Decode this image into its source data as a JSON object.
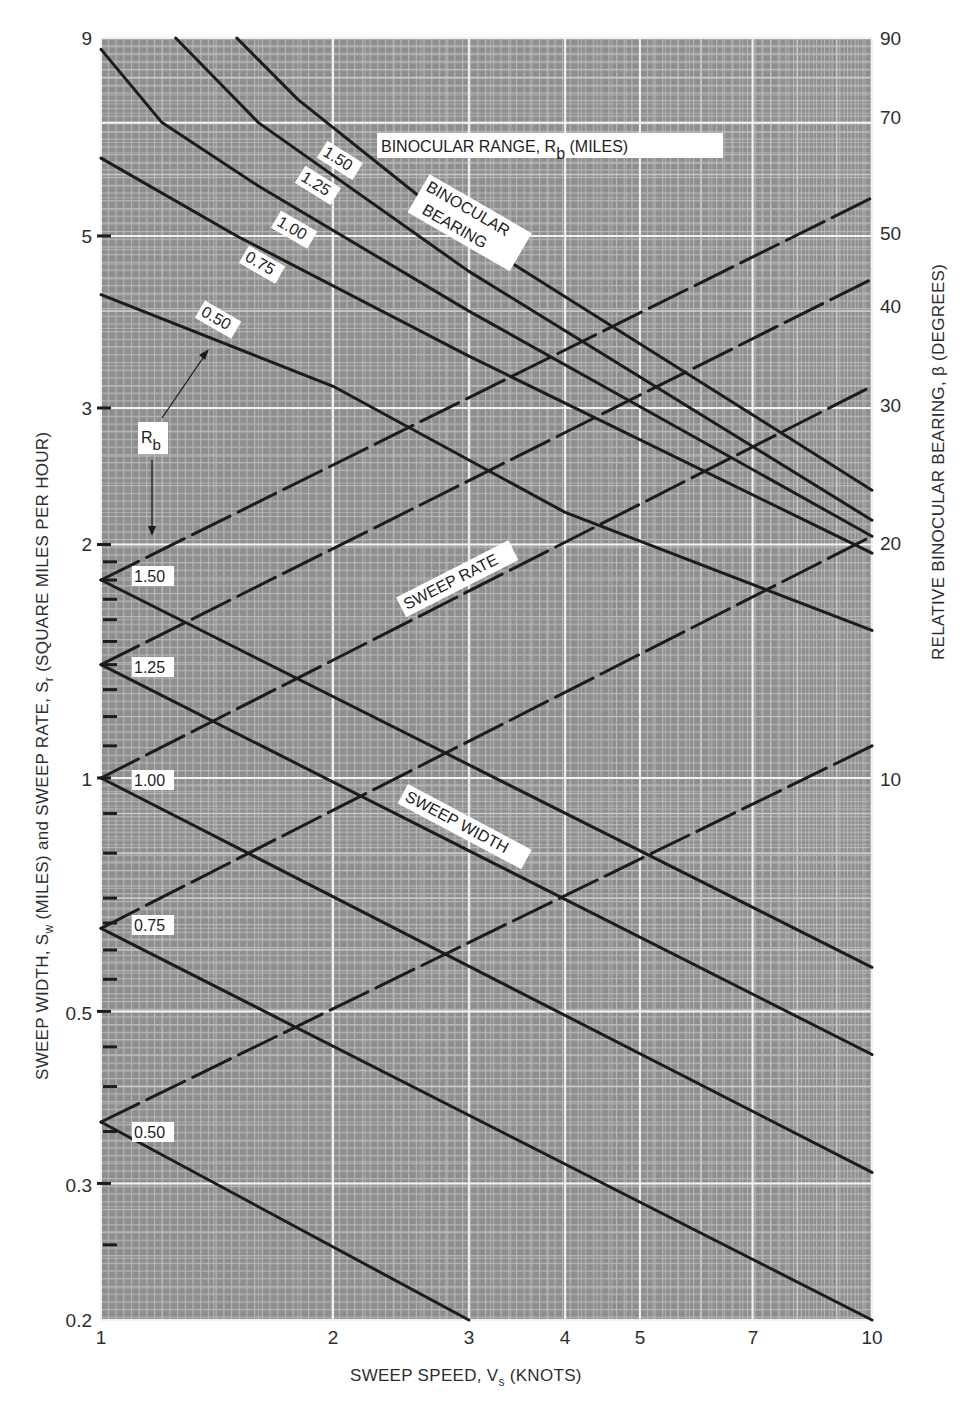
{
  "chart_data": {
    "type": "line",
    "xlabel": "SWEEP SPEED, V_s (KNOTS)",
    "ylabel_left": "SWEEP WIDTH, S_w (MILES) and SWEEP RATE, S_r (SQUARE MILES PER HOUR)",
    "ylabel_right": "RELATIVE BINOCULAR BEARING, β (DEGREES)",
    "x_scale": "log",
    "y_scale": "log",
    "xlim": [
      1,
      10
    ],
    "ylim": [
      0.2,
      9
    ],
    "x_ticks": [
      "1",
      "2",
      "3",
      "4",
      "5",
      "7",
      "10"
    ],
    "y_ticks_left": [
      "0.2",
      "0.3",
      "0.5",
      "1",
      "2",
      "3",
      "5",
      "9"
    ],
    "y_ticks_right": [
      "10",
      "20",
      "30",
      "40",
      "50",
      "70",
      "90"
    ],
    "grid": true,
    "annotations": [
      "BINOCULAR RANGE, R_b (MILES)",
      "BINOCULAR BEARING",
      "SWEEP RATE",
      "SWEEP WIDTH",
      "R_b"
    ],
    "series": [
      {
        "name": "Sweep width R_b=0.50",
        "style": "solid",
        "x": [
          1,
          3
        ],
        "y": [
          0.36,
          0.2
        ]
      },
      {
        "name": "Sweep width R_b=0.75",
        "style": "solid",
        "x": [
          1,
          10
        ],
        "y": [
          0.64,
          0.2
        ]
      },
      {
        "name": "Sweep width R_b=1.00",
        "style": "solid",
        "x": [
          1,
          10
        ],
        "y": [
          1.0,
          0.31
        ]
      },
      {
        "name": "Sweep width R_b=1.25",
        "style": "solid",
        "x": [
          1,
          10
        ],
        "y": [
          1.4,
          0.44
        ]
      },
      {
        "name": "Sweep width R_b=1.50",
        "style": "solid",
        "x": [
          1,
          10
        ],
        "y": [
          1.8,
          0.57
        ]
      },
      {
        "name": "Sweep rate R_b=0.50",
        "style": "dashed",
        "x": [
          1,
          10
        ],
        "y": [
          0.36,
          1.1
        ]
      },
      {
        "name": "Sweep rate R_b=0.75",
        "style": "dashed",
        "x": [
          1,
          10
        ],
        "y": [
          0.64,
          2.05
        ]
      },
      {
        "name": "Sweep rate R_b=1.00",
        "style": "dashed",
        "x": [
          1,
          10
        ],
        "y": [
          1.0,
          3.2
        ]
      },
      {
        "name": "Sweep rate R_b=1.25",
        "style": "dashed",
        "x": [
          1,
          10
        ],
        "y": [
          1.4,
          4.4
        ]
      },
      {
        "name": "Sweep rate R_b=1.50",
        "style": "dashed",
        "x": [
          1,
          10
        ],
        "y": [
          1.8,
          5.6
        ]
      },
      {
        "name": "Binocular bearing R_b=0.50",
        "style": "solid",
        "x": [
          1,
          2,
          4,
          10
        ],
        "y": [
          4.2,
          3.2,
          2.2,
          1.55
        ]
      },
      {
        "name": "Binocular bearing R_b=0.75",
        "style": "solid",
        "x": [
          1,
          1.5,
          3,
          10
        ],
        "y": [
          6.3,
          5.0,
          3.5,
          1.95
        ]
      },
      {
        "name": "Binocular bearing R_b=1.00",
        "style": "solid",
        "x": [
          1,
          1.2,
          1.6,
          3,
          10
        ],
        "y": [
          8.7,
          7.0,
          5.8,
          4.0,
          2.05
        ]
      },
      {
        "name": "Binocular bearing R_b=1.25",
        "style": "solid",
        "x": [
          1.25,
          1.6,
          3,
          10
        ],
        "y": [
          9.0,
          7.0,
          4.5,
          2.15
        ]
      },
      {
        "name": "Binocular bearing R_b=1.50",
        "style": "solid",
        "x": [
          1.5,
          1.8,
          3,
          10
        ],
        "y": [
          9.0,
          7.5,
          5.0,
          2.35
        ]
      }
    ]
  },
  "labels": {
    "x_title_main": "SWEEP SPEED, V",
    "x_title_sub": "s",
    "x_title_tail": " (KNOTS)",
    "y_left_a": "SWEEP WIDTH, S",
    "y_left_a_sub": "w",
    "y_left_b": " (MILES) and SWEEP RATE, S",
    "y_left_b_sub": "r",
    "y_left_c": " (SQUARE MILES PER HOUR)",
    "y_right": "RELATIVE BINOCULAR BEARING, β (DEGREES)",
    "range_title_main": "BINOCULAR RANGE, R",
    "range_title_sub": "b",
    "range_title_tail": " (MILES)",
    "bearing_line1": "BINOCULAR",
    "bearing_line2": "BEARING",
    "sweep_rate": "SWEEP RATE",
    "sweep_width": "SWEEP WIDTH",
    "rb_main": "R",
    "rb_sub": "b",
    "curve_labels": [
      "1.50",
      "1.25",
      "1.00",
      "0.75",
      "0.50"
    ],
    "vertex_labels": [
      "1.50",
      "1.25",
      "1.00",
      "0.75",
      "0.50"
    ]
  },
  "colors": {
    "plot_bg": "#8e8e8e",
    "grid_minor": "#c9c9c9",
    "grid_major": "#f2f2f2",
    "line": "#1c1c1c",
    "text": "#2e2e2e"
  }
}
